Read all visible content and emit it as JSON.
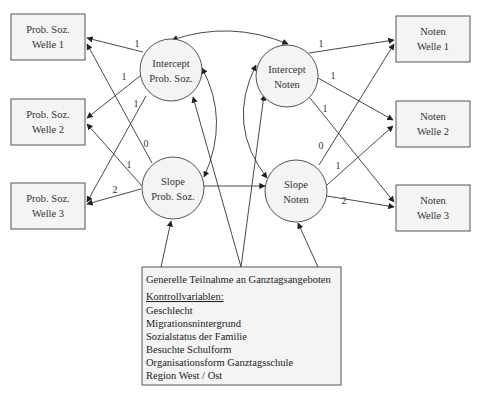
{
  "nodes": {
    "ps_w1": {
      "line1": "Prob. Soz.",
      "line2": "Welle 1"
    },
    "ps_w2": {
      "line1": "Prob. Soz.",
      "line2": "Welle 2"
    },
    "ps_w3": {
      "line1": "Prob. Soz.",
      "line2": "Welle 3"
    },
    "n_w1": {
      "line1": "Noten",
      "line2": "Welle 1"
    },
    "n_w2": {
      "line1": "Noten",
      "line2": "Welle 2"
    },
    "n_w3": {
      "line1": "Noten",
      "line2": "Welle 3"
    },
    "int_ps": {
      "line1": "Intercept",
      "line2": "Prob. Soz."
    },
    "slope_ps": {
      "line1": "Slope",
      "line2": "Prob. Soz."
    },
    "int_n": {
      "line1": "Intercept",
      "line2": "Noten"
    },
    "slope_n": {
      "line1": "Slope",
      "line2": "Noten"
    }
  },
  "loadings": {
    "int_ps_w1": "1",
    "int_ps_w2": "1",
    "int_ps_w3": "1",
    "slope_ps_w1": "0",
    "slope_ps_w2": "1",
    "slope_ps_w3": "2",
    "int_n_w1": "1",
    "int_n_w2": "1",
    "int_n_w3": "1",
    "slope_n_w1": "0",
    "slope_n_w2": "1",
    "slope_n_w3": "2"
  },
  "covariates": {
    "title": "Generelle Teilnahme an Ganztagsangeboten",
    "heading": "Kontrollvariablen:",
    "items": [
      "Geschlecht",
      "Migrationsnintergrund",
      "Sozialstatus der Familie",
      "Besuchte Schulform",
      "Organisationsform Ganztagsschule",
      "Region West / Ost"
    ]
  }
}
